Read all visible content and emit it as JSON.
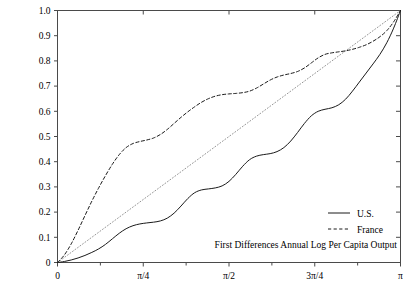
{
  "chart_data": {
    "type": "line",
    "title": "",
    "subtitle": "",
    "caption": "First Differences Annual Log Per Capita Output",
    "xlabel": "",
    "ylabel": "",
    "xlim": [
      0,
      3.14159265
    ],
    "ylim": [
      0,
      1.0
    ],
    "grid": false,
    "legend_position": "bottom-right",
    "x_tick_values": [
      0,
      0.78539816,
      1.57079633,
      2.35619449,
      3.14159265
    ],
    "x_tick_labels": [
      "0",
      "π/4",
      "π/2",
      "3π/4",
      "π"
    ],
    "x_minor_tick_values": [
      0.39269908,
      1.17809725,
      1.96349541,
      2.74889357
    ],
    "y_tick_values": [
      0,
      0.1,
      0.2,
      0.3,
      0.4,
      0.5,
      0.6,
      0.7,
      0.8,
      0.9,
      1.0
    ],
    "y_tick_labels": [
      "0",
      "0.1",
      "0.2",
      "0.3",
      "0.4",
      "0.5",
      "0.6",
      "0.7",
      "0.8",
      "0.9",
      "1.0"
    ],
    "series": [
      {
        "name": "U.S.",
        "style": "solid",
        "color": "#1a1a1a",
        "legend_label": "U.S.",
        "x": [
          0.0,
          0.0628,
          0.1257,
          0.1885,
          0.2513,
          0.3142,
          0.377,
          0.4398,
          0.5027,
          0.5655,
          0.6283,
          0.6912,
          0.754,
          0.8168,
          0.8796,
          0.9425,
          1.0053,
          1.0681,
          1.131,
          1.1938,
          1.2566,
          1.3195,
          1.3823,
          1.4451,
          1.508,
          1.5708,
          1.6336,
          1.6965,
          1.7593,
          1.8221,
          1.885,
          1.9478,
          2.0106,
          2.0735,
          2.1363,
          2.1991,
          2.2619,
          2.3248,
          2.3876,
          2.4504,
          2.5133,
          2.5761,
          2.6389,
          2.7018,
          2.7646,
          2.8274,
          2.8903,
          2.9531,
          3.0159,
          3.0788,
          3.14159
        ],
        "y": [
          0.0,
          0.004,
          0.01,
          0.018,
          0.028,
          0.04,
          0.054,
          0.072,
          0.094,
          0.116,
          0.134,
          0.146,
          0.153,
          0.157,
          0.16,
          0.165,
          0.176,
          0.196,
          0.224,
          0.254,
          0.277,
          0.288,
          0.292,
          0.296,
          0.304,
          0.322,
          0.35,
          0.382,
          0.408,
          0.422,
          0.428,
          0.432,
          0.44,
          0.456,
          0.482,
          0.516,
          0.552,
          0.582,
          0.6,
          0.608,
          0.614,
          0.626,
          0.648,
          0.68,
          0.716,
          0.752,
          0.788,
          0.826,
          0.872,
          0.93,
          1.0
        ]
      },
      {
        "name": "France",
        "style": "dashed",
        "color": "#1a1a1a",
        "legend_label": "France",
        "x": [
          0.0,
          0.0628,
          0.1257,
          0.1885,
          0.2513,
          0.3142,
          0.377,
          0.4398,
          0.5027,
          0.5655,
          0.6283,
          0.6912,
          0.754,
          0.8168,
          0.8796,
          0.9425,
          1.0053,
          1.0681,
          1.131,
          1.1938,
          1.2566,
          1.3195,
          1.3823,
          1.4451,
          1.508,
          1.5708,
          1.6336,
          1.6965,
          1.7593,
          1.8221,
          1.885,
          1.9478,
          2.0106,
          2.0735,
          2.1363,
          2.1991,
          2.2619,
          2.3248,
          2.3876,
          2.4504,
          2.5133,
          2.5761,
          2.6389,
          2.7018,
          2.7646,
          2.8274,
          2.8903,
          2.9531,
          3.0159,
          3.0788,
          3.14159
        ],
        "y": [
          0.0,
          0.03,
          0.074,
          0.128,
          0.186,
          0.243,
          0.296,
          0.345,
          0.39,
          0.428,
          0.456,
          0.472,
          0.48,
          0.486,
          0.494,
          0.508,
          0.528,
          0.552,
          0.576,
          0.598,
          0.618,
          0.636,
          0.65,
          0.66,
          0.666,
          0.669,
          0.671,
          0.674,
          0.68,
          0.692,
          0.708,
          0.724,
          0.736,
          0.744,
          0.75,
          0.758,
          0.772,
          0.792,
          0.812,
          0.826,
          0.832,
          0.836,
          0.84,
          0.846,
          0.854,
          0.864,
          0.878,
          0.896,
          0.92,
          0.955,
          1.0
        ]
      },
      {
        "name": "45-degree reference",
        "style": "dotted",
        "color": "#8a8a8a",
        "legend_label": "",
        "x": [
          0.0,
          3.14159265
        ],
        "y": [
          0.0,
          1.0
        ]
      }
    ]
  }
}
